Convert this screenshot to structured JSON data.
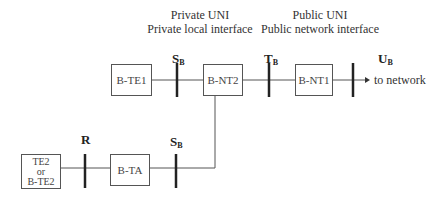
{
  "headers": {
    "private": {
      "line1": "Private UNI",
      "line2": "Private local interface"
    },
    "public": {
      "line1": "Public UNI",
      "line2": "Public network interface"
    }
  },
  "reference_points": {
    "sb_top": {
      "letter": "S",
      "sub": "B"
    },
    "tb": {
      "letter": "T",
      "sub": "B"
    },
    "ub": {
      "letter": "U",
      "sub": "B"
    },
    "r": {
      "letter": "R",
      "sub": ""
    },
    "sb_bottom": {
      "letter": "S",
      "sub": "B"
    }
  },
  "boxes": {
    "bte1": "B-TE1",
    "bnt2": "B-NT2",
    "bnt1": "B-NT1",
    "bta": "B-TA",
    "te2": {
      "line1": "TE2",
      "line2": "or",
      "line3": "B-TE2"
    }
  },
  "arrow_label": "to network",
  "colors": {
    "line": "#555555",
    "bar": "#222222",
    "text": "#333333"
  }
}
